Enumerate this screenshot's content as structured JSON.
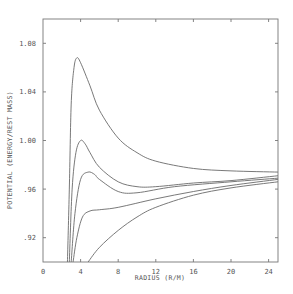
{
  "chart_data": {
    "type": "line",
    "title": "",
    "xlabel": "RADIUS (R/M)",
    "ylabel": "POTENTIAL (ENERGY/REST MASS)",
    "xlim": [
      0,
      25
    ],
    "ylim": [
      0.9,
      1.1
    ],
    "grid": false,
    "legend": null,
    "x_ticks": [
      0,
      4,
      8,
      12,
      16,
      20,
      24
    ],
    "x_tick_labels": [
      "0",
      "4",
      "8",
      "12",
      "16",
      "20",
      "24"
    ],
    "y_ticks": [
      0.92,
      0.96,
      1.0,
      1.04,
      1.08
    ],
    "y_tick_labels": [
      ".92",
      ".96",
      "1.00",
      "1.04",
      "1.08"
    ],
    "series": [
      {
        "name": "curve-1",
        "x": [
          2.6,
          2.8,
          3.0,
          3.3,
          3.6,
          4.0,
          5.0,
          6.0,
          8.0,
          10.0,
          12.0,
          16.0,
          20.0,
          25.0
        ],
        "values": [
          0.9,
          0.96,
          1.03,
          1.06,
          1.068,
          1.064,
          1.045,
          1.025,
          1.002,
          0.99,
          0.983,
          0.977,
          0.975,
          0.974
        ]
      },
      {
        "name": "curve-2",
        "x": [
          2.8,
          3.1,
          3.5,
          4.0,
          4.5,
          5.0,
          6.0,
          8.0,
          10.0,
          12.0,
          16.0,
          20.0,
          25.0
        ],
        "values": [
          0.9,
          0.96,
          0.99,
          1.0,
          0.997,
          0.99,
          0.978,
          0.966,
          0.962,
          0.962,
          0.965,
          0.967,
          0.971
        ]
      },
      {
        "name": "curve-3",
        "x": [
          3.0,
          3.4,
          4.0,
          4.8,
          5.5,
          6.0,
          8.0,
          10.0,
          14.0,
          20.0,
          25.0
        ],
        "values": [
          0.9,
          0.94,
          0.968,
          0.974,
          0.972,
          0.968,
          0.958,
          0.957,
          0.962,
          0.966,
          0.969
        ]
      },
      {
        "name": "curve-4",
        "x": [
          3.2,
          3.6,
          4.2,
          5.0,
          6.0,
          8.0,
          12.0,
          16.0,
          20.0,
          25.0
        ],
        "values": [
          0.9,
          0.92,
          0.937,
          0.942,
          0.943,
          0.945,
          0.952,
          0.958,
          0.963,
          0.968
        ]
      },
      {
        "name": "curve-5",
        "x": [
          4.8,
          6.0,
          8.0,
          10.0,
          12.0,
          16.0,
          20.0,
          25.0
        ],
        "values": [
          0.9,
          0.912,
          0.926,
          0.937,
          0.945,
          0.955,
          0.961,
          0.966
        ]
      }
    ]
  }
}
